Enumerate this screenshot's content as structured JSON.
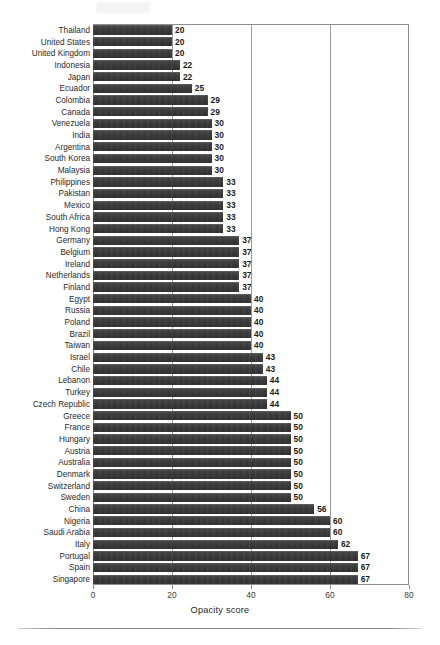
{
  "chart_data": {
    "type": "bar",
    "orientation": "horizontal",
    "title": "",
    "subtitle": "",
    "xlabel": "Opacity score",
    "ylabel": "",
    "xlim": [
      0,
      80
    ],
    "xticks": [
      0,
      20,
      40,
      60,
      80
    ],
    "xtick_labels": [
      "0",
      "20",
      "40",
      "60",
      "80"
    ],
    "grid": true,
    "grid_axis": "x",
    "legend": null,
    "bar_color": "#3a3a3a",
    "frame_color": "#8e8e8e",
    "value_labels": true,
    "categories": [
      "Thailand",
      "United States",
      "United Kingdom",
      "Indonesia",
      "Japan",
      "Ecuador",
      "Colombia",
      "Canada",
      "Venezuela",
      "India",
      "Argentina",
      "South Korea",
      "Malaysia",
      "Philippines",
      "Pakistan",
      "Mexico",
      "South Africa",
      "Hong Kong",
      "Germany",
      "Belgium",
      "Ireland",
      "Netherlands",
      "Finland",
      "Egypt",
      "Russia",
      "Poland",
      "Brazil",
      "Taiwan",
      "Israel",
      "Chile",
      "Lebanon",
      "Turkey",
      "Czech Republic",
      "Greece",
      "France",
      "Hungary",
      "Austria",
      "Australia",
      "Denmark",
      "Switzerland",
      "Sweden",
      "China",
      "Nigeria",
      "Saudi Arabia",
      "Italy",
      "Portugal",
      "Spain",
      "Singapore"
    ],
    "values": [
      20,
      20,
      20,
      22,
      22,
      25,
      29,
      29,
      30,
      30,
      30,
      30,
      30,
      33,
      33,
      33,
      33,
      33,
      37,
      37,
      37,
      37,
      37,
      40,
      40,
      40,
      40,
      40,
      43,
      43,
      44,
      44,
      44,
      50,
      50,
      50,
      50,
      50,
      50,
      50,
      50,
      56,
      60,
      60,
      62,
      67,
      67,
      67
    ]
  }
}
